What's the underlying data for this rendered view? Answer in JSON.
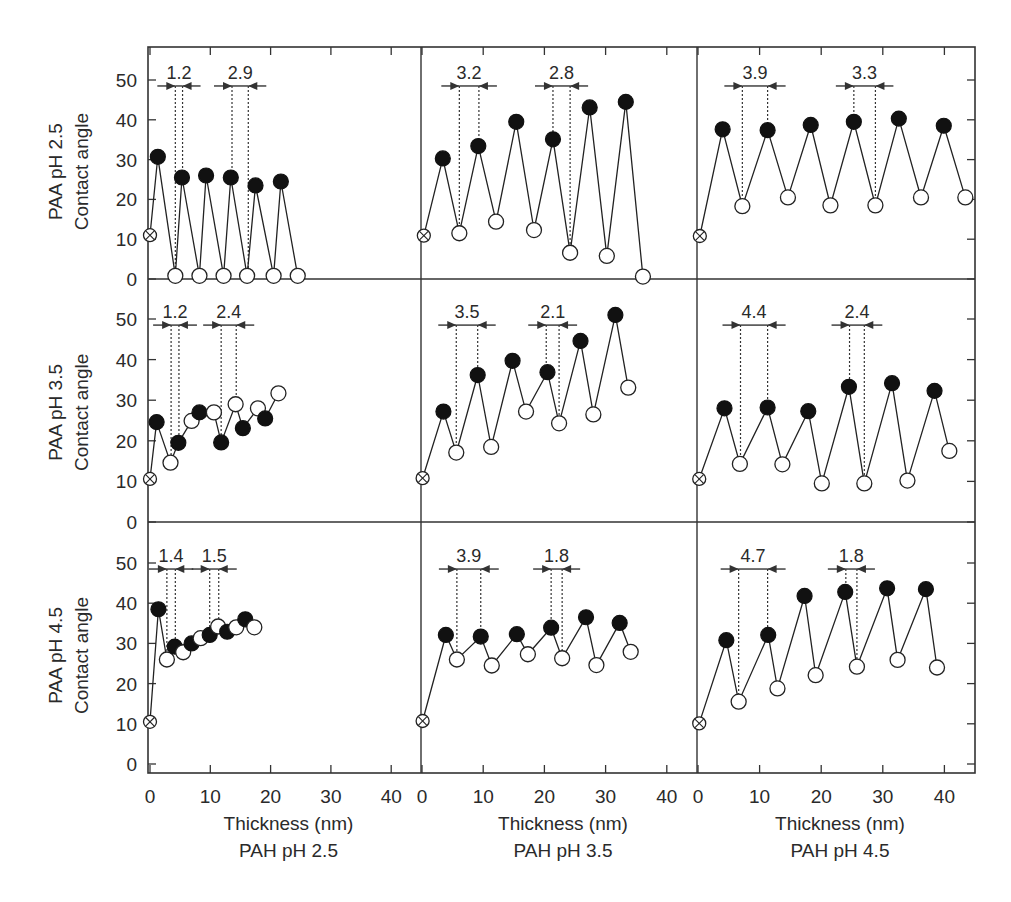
{
  "chart_data": {
    "type": "scatter",
    "layout": "3x3 grid of line+marker panels with shared axes",
    "title": "",
    "y_axis_ticks": [
      "0",
      "10",
      "20",
      "30",
      "40",
      "50"
    ],
    "x_axis_ticks": [
      "0",
      "10",
      "20",
      "30",
      "40"
    ],
    "ylim": [
      0,
      55
    ],
    "xlim": [
      0,
      44
    ],
    "grid": false,
    "legend": "none",
    "row_labels": [
      {
        "title": "PAA pH 2.5",
        "ylabel": "Contact angle"
      },
      {
        "title": "PAA pH 3.5",
        "ylabel": "Contact angle"
      },
      {
        "title": "PAA pH 4.5",
        "ylabel": "Contact angle"
      }
    ],
    "column_labels": [
      {
        "xlabel": "Thickness (nm)",
        "title": "PAH pH 2.5"
      },
      {
        "xlabel": "Thickness (nm)",
        "title": "PAH pH 3.5"
      },
      {
        "xlabel": "Thickness (nm)",
        "title": "PAH pH 4.5"
      }
    ],
    "marker_legend": {
      "crossed": "bare substrate",
      "filled": "PAH-terminated layer",
      "open": "PAA-terminated layer"
    },
    "panels": [
      {
        "row": 0,
        "col": 0,
        "paa_ph": "2.5",
        "pah_ph": "2.5",
        "points": [
          {
            "x": 0.0,
            "y": 11.0,
            "m": "crossed"
          },
          {
            "x": 1.3,
            "y": 30.7,
            "m": "filled"
          },
          {
            "x": 4.2,
            "y": 0.8,
            "m": "open"
          },
          {
            "x": 5.3,
            "y": 25.5,
            "m": "filled"
          },
          {
            "x": 8.2,
            "y": 0.8,
            "m": "open"
          },
          {
            "x": 9.3,
            "y": 26.0,
            "m": "filled"
          },
          {
            "x": 12.2,
            "y": 0.8,
            "m": "open"
          },
          {
            "x": 13.4,
            "y": 25.5,
            "m": "filled"
          },
          {
            "x": 16.1,
            "y": 0.8,
            "m": "open"
          },
          {
            "x": 17.5,
            "y": 23.5,
            "m": "filled"
          },
          {
            "x": 20.5,
            "y": 0.8,
            "m": "open"
          },
          {
            "x": 21.7,
            "y": 24.5,
            "m": "filled"
          },
          {
            "x": 24.5,
            "y": 0.8,
            "m": "open"
          }
        ],
        "annotations": [
          {
            "label": "1.2",
            "x1": 4.2,
            "x2": 5.4,
            "y_top": 48.5
          },
          {
            "label": "2.9",
            "x1": 13.6,
            "x2": 16.3,
            "y_top": 48.5
          }
        ]
      },
      {
        "row": 0,
        "col": 1,
        "paa_ph": "2.5",
        "pah_ph": "3.5",
        "points": [
          {
            "x": 0.3,
            "y": 10.9,
            "m": "crossed"
          },
          {
            "x": 3.4,
            "y": 30.3,
            "m": "filled"
          },
          {
            "x": 6.1,
            "y": 11.5,
            "m": "open"
          },
          {
            "x": 9.2,
            "y": 33.4,
            "m": "filled"
          },
          {
            "x": 12.1,
            "y": 14.4,
            "m": "open"
          },
          {
            "x": 15.4,
            "y": 39.5,
            "m": "filled"
          },
          {
            "x": 18.3,
            "y": 12.3,
            "m": "open"
          },
          {
            "x": 21.4,
            "y": 35.1,
            "m": "filled"
          },
          {
            "x": 24.2,
            "y": 6.6,
            "m": "open"
          },
          {
            "x": 27.4,
            "y": 43.1,
            "m": "filled"
          },
          {
            "x": 30.2,
            "y": 5.8,
            "m": "open"
          },
          {
            "x": 33.3,
            "y": 44.5,
            "m": "filled"
          },
          {
            "x": 36.1,
            "y": 0.6,
            "m": "open"
          }
        ],
        "annotations": [
          {
            "label": "3.2",
            "x1": 6.1,
            "x2": 9.3,
            "y_top": 48.5
          },
          {
            "label": "2.8",
            "x1": 21.4,
            "x2": 24.2,
            "y_top": 48.5
          }
        ]
      },
      {
        "row": 0,
        "col": 2,
        "paa_ph": "2.5",
        "pah_ph": "4.5",
        "points": [
          {
            "x": 0.3,
            "y": 10.8,
            "m": "crossed"
          },
          {
            "x": 4.0,
            "y": 37.6,
            "m": "filled"
          },
          {
            "x": 7.2,
            "y": 18.3,
            "m": "open"
          },
          {
            "x": 11.3,
            "y": 37.4,
            "m": "filled"
          },
          {
            "x": 14.6,
            "y": 20.5,
            "m": "open"
          },
          {
            "x": 18.3,
            "y": 38.7,
            "m": "filled"
          },
          {
            "x": 21.5,
            "y": 18.5,
            "m": "open"
          },
          {
            "x": 25.3,
            "y": 39.5,
            "m": "filled"
          },
          {
            "x": 28.8,
            "y": 18.5,
            "m": "open"
          },
          {
            "x": 32.6,
            "y": 40.3,
            "m": "filled"
          },
          {
            "x": 36.2,
            "y": 20.5,
            "m": "open"
          },
          {
            "x": 39.9,
            "y": 38.5,
            "m": "filled"
          },
          {
            "x": 43.4,
            "y": 20.5,
            "m": "open"
          }
        ],
        "annotations": [
          {
            "label": "3.9",
            "x1": 7.2,
            "x2": 11.3,
            "y_top": 48.5
          },
          {
            "label": "3.3",
            "x1": 25.3,
            "x2": 28.8,
            "y_top": 48.5
          }
        ]
      },
      {
        "row": 1,
        "col": 0,
        "paa_ph": "3.5",
        "pah_ph": "2.5",
        "points": [
          {
            "x": 0.0,
            "y": 10.6,
            "m": "crossed"
          },
          {
            "x": 1.1,
            "y": 24.6,
            "m": "filled"
          },
          {
            "x": 3.4,
            "y": 14.6,
            "m": "open"
          },
          {
            "x": 4.7,
            "y": 19.5,
            "m": "filled"
          },
          {
            "x": 6.9,
            "y": 24.9,
            "m": "open"
          },
          {
            "x": 8.2,
            "y": 27.0,
            "m": "filled"
          },
          {
            "x": 10.6,
            "y": 27.0,
            "m": "open"
          },
          {
            "x": 11.8,
            "y": 19.6,
            "m": "filled"
          },
          {
            "x": 14.2,
            "y": 29.0,
            "m": "open"
          },
          {
            "x": 15.4,
            "y": 23.1,
            "m": "filled"
          },
          {
            "x": 17.9,
            "y": 28.0,
            "m": "open"
          },
          {
            "x": 19.1,
            "y": 25.5,
            "m": "filled"
          },
          {
            "x": 21.3,
            "y": 31.7,
            "m": "open"
          }
        ],
        "annotations": [
          {
            "label": "1.2",
            "x1": 3.5,
            "x2": 4.8,
            "y_top": 48.5
          },
          {
            "label": "2.4",
            "x1": 11.8,
            "x2": 14.3,
            "y_top": 48.5
          }
        ]
      },
      {
        "row": 1,
        "col": 1,
        "paa_ph": "3.5",
        "pah_ph": "3.5",
        "points": [
          {
            "x": 0.1,
            "y": 10.8,
            "m": "crossed"
          },
          {
            "x": 3.5,
            "y": 27.2,
            "m": "filled"
          },
          {
            "x": 5.6,
            "y": 17.1,
            "m": "open"
          },
          {
            "x": 9.1,
            "y": 36.2,
            "m": "filled"
          },
          {
            "x": 11.3,
            "y": 18.5,
            "m": "open"
          },
          {
            "x": 14.8,
            "y": 39.7,
            "m": "filled"
          },
          {
            "x": 17.0,
            "y": 27.2,
            "m": "open"
          },
          {
            "x": 20.5,
            "y": 36.9,
            "m": "filled"
          },
          {
            "x": 22.4,
            "y": 24.3,
            "m": "open"
          },
          {
            "x": 25.9,
            "y": 44.6,
            "m": "filled"
          },
          {
            "x": 28.0,
            "y": 26.5,
            "m": "open"
          },
          {
            "x": 31.6,
            "y": 51.0,
            "m": "filled"
          },
          {
            "x": 33.7,
            "y": 33.1,
            "m": "open"
          }
        ],
        "annotations": [
          {
            "label": "3.5",
            "x1": 5.6,
            "x2": 9.1,
            "y_top": 48.5
          },
          {
            "label": "2.1",
            "x1": 20.3,
            "x2": 22.4,
            "y_top": 48.5
          }
        ]
      },
      {
        "row": 1,
        "col": 2,
        "paa_ph": "3.5",
        "pah_ph": "4.5",
        "points": [
          {
            "x": 0.2,
            "y": 10.6,
            "m": "crossed"
          },
          {
            "x": 4.3,
            "y": 28.0,
            "m": "filled"
          },
          {
            "x": 6.8,
            "y": 14.3,
            "m": "open"
          },
          {
            "x": 11.3,
            "y": 28.2,
            "m": "filled"
          },
          {
            "x": 13.7,
            "y": 14.2,
            "m": "open"
          },
          {
            "x": 17.9,
            "y": 27.3,
            "m": "filled"
          },
          {
            "x": 20.1,
            "y": 9.5,
            "m": "open"
          },
          {
            "x": 24.5,
            "y": 33.3,
            "m": "filled"
          },
          {
            "x": 27.0,
            "y": 9.5,
            "m": "open"
          },
          {
            "x": 31.5,
            "y": 34.2,
            "m": "filled"
          },
          {
            "x": 34.0,
            "y": 10.2,
            "m": "open"
          },
          {
            "x": 38.4,
            "y": 32.3,
            "m": "filled"
          },
          {
            "x": 40.8,
            "y": 17.5,
            "m": "open"
          }
        ],
        "annotations": [
          {
            "label": "4.4",
            "x1": 6.9,
            "x2": 11.3,
            "y_top": 48.5
          },
          {
            "label": "2.4",
            "x1": 24.6,
            "x2": 27.0,
            "y_top": 48.5
          }
        ]
      },
      {
        "row": 2,
        "col": 0,
        "paa_ph": "4.5",
        "pah_ph": "2.5",
        "points": [
          {
            "x": 0.0,
            "y": 10.5,
            "m": "crossed"
          },
          {
            "x": 1.4,
            "y": 38.5,
            "m": "filled"
          },
          {
            "x": 2.8,
            "y": 26.0,
            "m": "open"
          },
          {
            "x": 4.1,
            "y": 29.2,
            "m": "filled"
          },
          {
            "x": 5.5,
            "y": 27.8,
            "m": "open"
          },
          {
            "x": 6.9,
            "y": 30.0,
            "m": "filled"
          },
          {
            "x": 8.4,
            "y": 31.3,
            "m": "open"
          },
          {
            "x": 9.9,
            "y": 32.1,
            "m": "filled"
          },
          {
            "x": 11.3,
            "y": 34.2,
            "m": "open"
          },
          {
            "x": 12.8,
            "y": 32.9,
            "m": "filled"
          },
          {
            "x": 14.3,
            "y": 34.0,
            "m": "open"
          },
          {
            "x": 15.8,
            "y": 36.0,
            "m": "filled"
          },
          {
            "x": 17.3,
            "y": 34.0,
            "m": "open"
          }
        ],
        "annotations": [
          {
            "label": "1.4",
            "x1": 2.8,
            "x2": 4.2,
            "y_top": 48.5
          },
          {
            "label": "1.5",
            "x1": 9.9,
            "x2": 11.4,
            "y_top": 48.5
          }
        ]
      },
      {
        "row": 2,
        "col": 1,
        "paa_ph": "4.5",
        "pah_ph": "3.5",
        "points": [
          {
            "x": 0.1,
            "y": 10.7,
            "m": "crossed"
          },
          {
            "x": 3.9,
            "y": 32.1,
            "m": "filled"
          },
          {
            "x": 5.7,
            "y": 26.0,
            "m": "open"
          },
          {
            "x": 9.6,
            "y": 31.7,
            "m": "filled"
          },
          {
            "x": 11.4,
            "y": 24.5,
            "m": "open"
          },
          {
            "x": 15.5,
            "y": 32.3,
            "m": "filled"
          },
          {
            "x": 17.3,
            "y": 27.3,
            "m": "open"
          },
          {
            "x": 21.1,
            "y": 33.9,
            "m": "filled"
          },
          {
            "x": 22.9,
            "y": 26.3,
            "m": "open"
          },
          {
            "x": 26.8,
            "y": 36.5,
            "m": "filled"
          },
          {
            "x": 28.5,
            "y": 24.6,
            "m": "open"
          },
          {
            "x": 32.3,
            "y": 35.1,
            "m": "filled"
          },
          {
            "x": 34.1,
            "y": 27.9,
            "m": "open"
          }
        ],
        "annotations": [
          {
            "label": "3.9",
            "x1": 5.7,
            "x2": 9.6,
            "y_top": 48.5
          },
          {
            "label": "1.8",
            "x1": 21.1,
            "x2": 22.9,
            "y_top": 48.5
          }
        ]
      },
      {
        "row": 2,
        "col": 2,
        "paa_ph": "4.5",
        "pah_ph": "4.5",
        "points": [
          {
            "x": 0.2,
            "y": 10.1,
            "m": "crossed"
          },
          {
            "x": 4.6,
            "y": 30.8,
            "m": "filled"
          },
          {
            "x": 6.6,
            "y": 15.5,
            "m": "open"
          },
          {
            "x": 11.4,
            "y": 32.1,
            "m": "filled"
          },
          {
            "x": 12.9,
            "y": 18.8,
            "m": "open"
          },
          {
            "x": 17.3,
            "y": 41.8,
            "m": "filled"
          },
          {
            "x": 19.1,
            "y": 22.1,
            "m": "open"
          },
          {
            "x": 23.9,
            "y": 42.8,
            "m": "filled"
          },
          {
            "x": 25.8,
            "y": 24.2,
            "m": "open"
          },
          {
            "x": 30.7,
            "y": 43.7,
            "m": "filled"
          },
          {
            "x": 32.4,
            "y": 25.9,
            "m": "open"
          },
          {
            "x": 37.0,
            "y": 43.5,
            "m": "filled"
          },
          {
            "x": 38.8,
            "y": 24.0,
            "m": "open"
          }
        ],
        "annotations": [
          {
            "label": "4.7",
            "x1": 6.6,
            "x2": 11.3,
            "y_top": 48.5
          },
          {
            "label": "1.8",
            "x1": 24.0,
            "x2": 25.8,
            "y_top": 48.5
          }
        ]
      }
    ]
  }
}
